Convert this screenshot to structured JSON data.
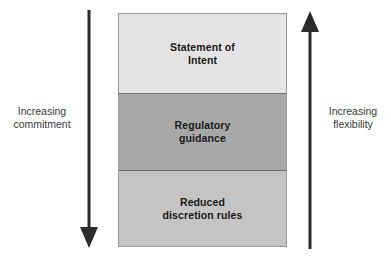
{
  "diagram": {
    "background_color": "#ffffff",
    "bands": [
      {
        "id": "statement-of-intent",
        "label": "Statement of\nIntent",
        "fill": "#e3e3e3"
      },
      {
        "id": "regulatory-guidance",
        "label": "Regulatory\nguidance",
        "fill": "#a8a8a8"
      },
      {
        "id": "reduced-discretion-rules",
        "label": "Reduced\ndiscretion rules",
        "fill": "#c4c4c4"
      }
    ],
    "axes": [
      {
        "id": "commitment",
        "label": "Increasing\ncommitment",
        "direction": "down",
        "icon": "arrow-down-icon",
        "color": "#2b2b2b"
      },
      {
        "id": "flexibility",
        "label": "Increasing\nflexibility",
        "direction": "up",
        "icon": "arrow-up-icon",
        "color": "#2b2b2b"
      }
    ],
    "border_color": "#9a9a9a",
    "text_color": "#1a1a1a",
    "label_color": "#3a3a3a"
  }
}
